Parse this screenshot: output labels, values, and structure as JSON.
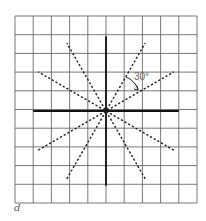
{
  "figure": {
    "label": "d",
    "angle_label": "30°",
    "grid": {
      "rows": 10,
      "cols": 10,
      "x0": 15,
      "y0": 16,
      "x1": 197,
      "y1": 203
    },
    "center": {
      "x": 106,
      "y": 111
    },
    "axes": {
      "horizontal_half_length_cells": 4,
      "vertical_half_length_cells": 4
    },
    "dashed_line_angles_deg": [
      30,
      60,
      120,
      150
    ],
    "colors": {
      "grid": "#555555",
      "axis": "#111111",
      "dashed": "#222222"
    }
  }
}
